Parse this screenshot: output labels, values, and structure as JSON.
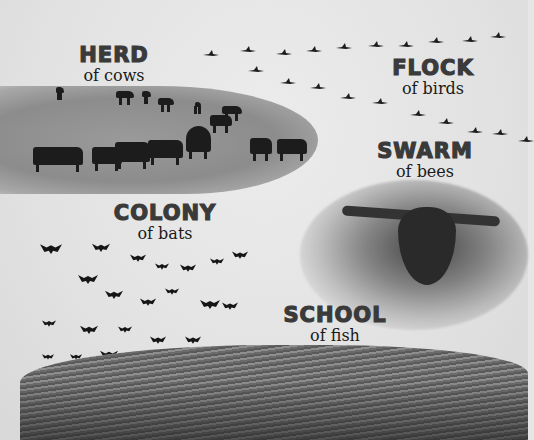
{
  "groups": [
    {
      "title": "HERD",
      "subtitle": "of cows"
    },
    {
      "title": "FLOCK",
      "subtitle": "of birds"
    },
    {
      "title": "SWARM",
      "subtitle": "of bees"
    },
    {
      "title": "COLONY",
      "subtitle": "of bats"
    },
    {
      "title": "SCHOOL",
      "subtitle": "of fish"
    }
  ],
  "colors": {
    "background": "#e6e6e6",
    "title_text": "#3a3a3a",
    "subtitle_text": "#1a1a1a",
    "silhouette": "#1c1c1c"
  }
}
